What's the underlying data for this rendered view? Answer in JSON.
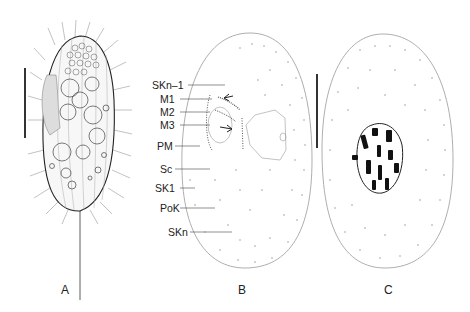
{
  "figure": {
    "panels": [
      {
        "id": "A",
        "label": "A",
        "description": "ciliate cell, ventral view in vivo with cilia, vacuoles and caudal cilium"
      },
      {
        "id": "B",
        "label": "B",
        "description": "ventral view, infraciliature"
      },
      {
        "id": "C",
        "label": "C",
        "description": "dorsal view, infraciliature and macronucleus"
      }
    ],
    "annotations_B": [
      {
        "key": "skn1",
        "text": "SKn–1"
      },
      {
        "key": "m1",
        "text": "M1"
      },
      {
        "key": "m2",
        "text": "M2"
      },
      {
        "key": "m3",
        "text": "M3"
      },
      {
        "key": "pm",
        "text": "PM"
      },
      {
        "key": "sc",
        "text": "Sc"
      },
      {
        "key": "sk1",
        "text": "SK1"
      },
      {
        "key": "pok",
        "text": "PoK"
      },
      {
        "key": "skn",
        "text": "SKn"
      }
    ],
    "scale_bars": 2,
    "colors": {
      "ink": "#222222",
      "background": "#ffffff",
      "outline": "#888888"
    }
  }
}
